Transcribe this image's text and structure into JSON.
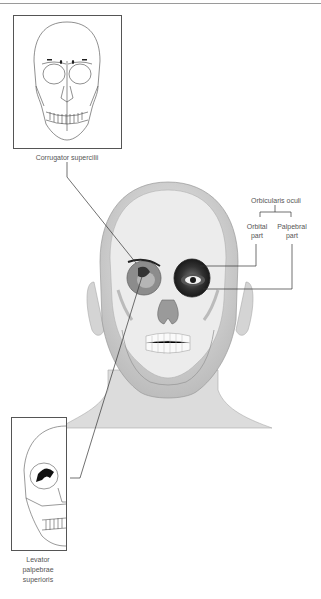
{
  "diagram": {
    "labels": {
      "corrugator": "Corrugator supercilii",
      "orbicularis": "Orbicularis oculi",
      "orbital_part_line1": "Orbital",
      "orbital_part_line2": "part",
      "palpebral_part_line1": "Palpebral",
      "palpebral_part_line2": "part",
      "levator_line1": "Levator",
      "levator_line2": "palpebrae",
      "levator_line3": "superioris"
    },
    "insets": [
      {
        "name": "frontal-skull-inset",
        "view": "anterior skull"
      },
      {
        "name": "lateral-skull-inset",
        "view": "oblique skull with orbit"
      }
    ],
    "colors": {
      "line": "#333333",
      "frame": "#555555",
      "skin": "#d9d9d9",
      "bone": "#f2f2f2",
      "muscle_dark": "#2a2a2a",
      "label_text": "#555555"
    }
  }
}
